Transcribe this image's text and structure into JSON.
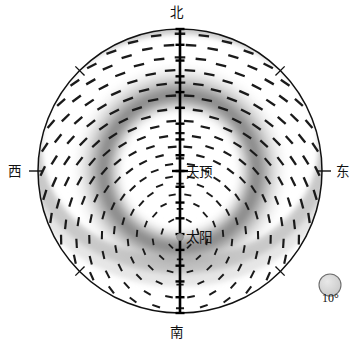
{
  "figure": {
    "type": "sky-polarization-polar-map",
    "cardinals": {
      "north": "北",
      "south": "南",
      "east": "东",
      "west": "西"
    },
    "markers": {
      "zenith_label": "天顶",
      "sun_label": "太阳",
      "sun_icon": "sun-dot-marker"
    },
    "legend": {
      "scale_label": "10°",
      "symbol": "degree-scale-circle"
    },
    "colors": {
      "outline": "#111111",
      "meridian": "#000000",
      "dash": "#1a1a1a",
      "band_dark": "#8a8a8a",
      "band_mid": "#b4b4b4",
      "band_light": "#dcdcdc",
      "sun_marker": "#9a9a9a",
      "legend_fill": "#d2d2d2",
      "background": "#ffffff"
    }
  },
  "chart_data": {
    "type": "scatter",
    "title": "",
    "subtitle": "",
    "xlabel": "",
    "ylabel": "",
    "projection": "polar-zenith-equidistant",
    "grid": false,
    "legend_position": "bottom-right",
    "axis_ranges": {
      "azimuth_deg": [
        0,
        360
      ],
      "zenith_angle_deg": [
        0,
        90
      ]
    },
    "center": {
      "x": 180,
      "y": 171,
      "label": "天顶"
    },
    "radius_px": 142,
    "cardinal_ticks_deg": [
      0,
      45,
      90,
      135,
      180,
      225,
      270,
      315
    ],
    "meridian_tick_count": 18,
    "meridian_tick_step_deg": 10,
    "sun": {
      "azimuth_deg": 180,
      "zenith_angle_deg": 42,
      "x": 180,
      "y": 237
    },
    "polarization_band": {
      "description": "maximum degree of polarization arc, 90 deg from sun",
      "center_zenith_angle_deg": 48,
      "band_half_width_deg": 11,
      "peak_gray": "#8a8a8a"
    },
    "e_vector_field": {
      "description": "dash segments perpendicular to the scattering plane through the sun",
      "ring_zenith_angles_deg": [
        8,
        16,
        24,
        32,
        40,
        48,
        56,
        64,
        72,
        80,
        87
      ],
      "dashes_per_ring": [
        6,
        10,
        14,
        18,
        22,
        26,
        30,
        32,
        34,
        36,
        36
      ],
      "dash_length_px": 9,
      "dash_width_px": 2.1
    },
    "legend_symbol": {
      "shape": "circle",
      "diameter_deg": 10,
      "label": "10°",
      "x": 330,
      "y": 285,
      "r_px": 11
    }
  }
}
